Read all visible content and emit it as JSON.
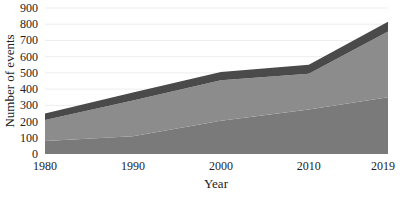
{
  "chart_data": {
    "type": "area",
    "stacked": true,
    "title": "",
    "xlabel": "Year",
    "ylabel": "Number of events",
    "x": [
      1980,
      1990,
      2000,
      2010,
      2019
    ],
    "x_tick_labels": [
      "1980",
      "1990",
      "2000",
      "2010",
      "2019"
    ],
    "y_tick_labels": [
      "0",
      "100",
      "200",
      "300",
      "400",
      "500",
      "600",
      "700",
      "800",
      "900"
    ],
    "ylim": [
      0,
      900
    ],
    "grid": true,
    "legend": null,
    "series": [
      {
        "name": "Bottom layer",
        "color": "#7a7a7a",
        "values": [
          80,
          110,
          205,
          275,
          350
        ]
      },
      {
        "name": "Middle layer",
        "color": "#8c8c8c",
        "values": [
          130,
          220,
          250,
          220,
          405
        ]
      },
      {
        "name": "Top layer",
        "color": "#4a4a4a",
        "values": [
          40,
          50,
          50,
          55,
          60
        ]
      }
    ]
  }
}
